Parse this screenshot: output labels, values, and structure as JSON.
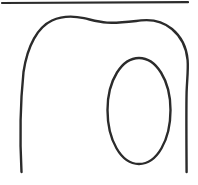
{
  "figure": {
    "width": 198,
    "height": 185,
    "background_color": "#ffffff",
    "ink_color": "#2b2b2b",
    "elements": [
      {
        "name": "top-rule",
        "kind": "line",
        "description": "Horizontal rule across the top of the image",
        "stroke_color": "#2b2b2b",
        "stroke_width": 2.2,
        "geometry": "M 2 3 L 188 2.2"
      },
      {
        "name": "outer-arch-outline",
        "kind": "open-curve",
        "description": "Large arch / tooth-like outline: left leg rising into a rounded top that waves gently, then down the right side into a right leg; both legs open at the bottom",
        "stroke_color": "#2b2b2b",
        "stroke_width": 2.4,
        "geometry": "M 21.5 172 C 19.8 140 20.2 104 23.5 72 C 27.5 45 38 27 52 20.5 C 63 15.5 75 16.2 84 18.2 C 92 20 98 22 107 22.6 C 118 23.3 130 21.6 141 20.4 C 152 19.2 163 21.5 172 29 C 181 36.5 186.5 47 187.6 60 C 188.4 69.5 187 80 186.6 92 C 186.2 108 186.4 142 186.6 172"
      },
      {
        "name": "inner-oval-outline",
        "kind": "closed-curve",
        "description": "Vertically elongated oval inside the right portion of the arch",
        "stroke_color": "#2b2b2b",
        "stroke_width": 2.4,
        "geometry": "M 139 58 C 156 58 170.5 80 170.5 110 C 170.5 140 157 164 139 164 C 121 164 107.5 140 107.5 110 C 107.5 80 122 58 139 58 Z"
      }
    ]
  }
}
